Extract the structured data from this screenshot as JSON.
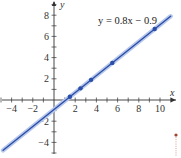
{
  "chart_data": {
    "type": "line",
    "title": "",
    "xlabel": "x",
    "ylabel": "y",
    "xlim": [
      -5,
      11
    ],
    "ylim": [
      -5,
      9
    ],
    "grid": false,
    "x_ticks": [
      -4,
      -2,
      2,
      4,
      6,
      8,
      10
    ],
    "y_ticks": [
      -4,
      -2,
      2,
      4,
      6,
      8
    ],
    "x_tick_labels": [
      "−4",
      "−2",
      "2",
      "4",
      "6",
      "8",
      "10"
    ],
    "y_tick_labels": [
      "−4",
      "−2",
      "2",
      "4",
      "6",
      "8"
    ],
    "series": [
      {
        "name": "y = 0.8x − 0.9",
        "type": "line",
        "slope": 0.8,
        "intercept": -0.9,
        "x": [
          -4.8,
          11
        ],
        "y": [
          -4.74,
          7.9
        ],
        "color": "#2b4fa8"
      },
      {
        "name": "data points",
        "type": "scatter",
        "x": [
          1.5,
          2.5,
          3.5,
          5.5,
          9.5
        ],
        "y": [
          0.3,
          1.1,
          1.9,
          3.5,
          6.7
        ],
        "color": "#2b4fa8"
      }
    ],
    "annotations": [
      {
        "text": "y = 0.8x − 0.9",
        "x": 5.5,
        "y": 7.6
      }
    ]
  },
  "labels": {
    "equation": "y = 0.8x − 0.9",
    "x_axis": "x",
    "y_axis": "y"
  },
  "colors": {
    "line": "#2b4fa8",
    "line_halo": "#b8c8ec",
    "axis": "#333333",
    "marker_accent": "#a0442c"
  }
}
